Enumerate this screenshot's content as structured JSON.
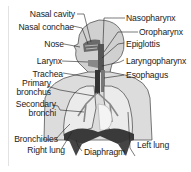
{
  "diagram": {
    "labels_left": [
      {
        "id": "nasal-cavity",
        "text": "Nasal cavity"
      },
      {
        "id": "nasal-conchae",
        "text": "Nasal conchae"
      },
      {
        "id": "nose",
        "text": "Nose"
      },
      {
        "id": "larynx",
        "text": "Larynx"
      },
      {
        "id": "trachea",
        "text": "Trachea"
      },
      {
        "id": "primary-bronchus",
        "text_line1": "Primary",
        "text_line2": "bronchus"
      },
      {
        "id": "secondary-bronchi",
        "text_line1": "Secondary",
        "text_line2": "bronchi"
      },
      {
        "id": "bronchioles",
        "text": "Bronchioles"
      },
      {
        "id": "right-lung",
        "text": "Right lung"
      }
    ],
    "labels_right": [
      {
        "id": "nasopharynx",
        "text": "Nasopharynx"
      },
      {
        "id": "oropharynx",
        "text": "Oropharynx"
      },
      {
        "id": "epiglottis",
        "text": "Epiglottis"
      },
      {
        "id": "laryngopharynx",
        "text": "Laryngopharynx"
      },
      {
        "id": "esophagus",
        "text": "Esophagus"
      },
      {
        "id": "left-lung",
        "text": "Left lung"
      }
    ],
    "labels_bottom": [
      {
        "id": "diaphragm",
        "text": "Diaphragm"
      }
    ],
    "colors": {
      "body_fill": "#d4d4d4",
      "body_stroke": "#555555",
      "lung_fill": "#e8e8e8",
      "diaphragm_fill": "#3a3a3a",
      "airway_fill": "#444444",
      "leader_line": "#222222"
    }
  }
}
